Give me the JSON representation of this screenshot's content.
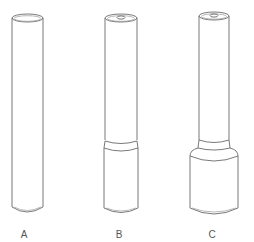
{
  "figure": {
    "line_color": "#6a6a6a",
    "background": "#ffffff",
    "items": [
      {
        "id": "A",
        "label": "A",
        "shape": "plain cylinder"
      },
      {
        "id": "B",
        "label": "B",
        "shape": "cylinder with central bore and slightly wider lower section"
      },
      {
        "id": "C",
        "label": "C",
        "shape": "cylinder with central bore and wide stepped base"
      }
    ]
  }
}
